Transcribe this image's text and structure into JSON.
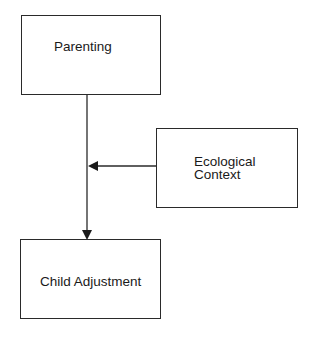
{
  "diagram": {
    "nodes": [
      {
        "id": "parenting",
        "label": "Parenting"
      },
      {
        "id": "ecological",
        "label_line1": "Ecological",
        "label_line2": "Context"
      },
      {
        "id": "child",
        "label": "Child Adjustment"
      }
    ],
    "edges": [
      {
        "from": "parenting",
        "to": "child",
        "type": "arrow"
      },
      {
        "from": "ecological",
        "to": "parenting->child edge",
        "type": "moderator-arrow"
      }
    ],
    "colors": {
      "stroke": "#2a2a2a",
      "background": "#ffffff"
    }
  }
}
